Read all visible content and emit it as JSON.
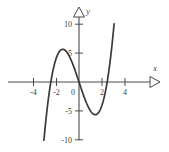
{
  "figure": {
    "background_color": "#ffffff",
    "axis_color": "#4a4a4a",
    "curve_color": "#3a3a3a",
    "label_color": "#3b3b3b"
  },
  "axes": {
    "x_axis_label": "x",
    "y_axis_label": "y",
    "x_arrow": "triangle-right",
    "y_arrow": "triangle-up",
    "x_tick_labels": [
      "-4",
      "-2",
      "0",
      "2",
      "4"
    ],
    "y_tick_labels": [
      "10",
      "5",
      "-5",
      "-10"
    ],
    "origin_label": "0"
  },
  "chart_data": {
    "type": "line",
    "title": "",
    "subtitle": "",
    "xlabel": "x",
    "ylabel": "y",
    "xlim": [
      -4.9,
      5.3
    ],
    "ylim": [
      -11.5,
      11.5
    ],
    "xticks": [
      -4,
      -2,
      0,
      2,
      4
    ],
    "yticks": [
      10,
      5,
      -5,
      -10
    ],
    "grid": false,
    "legend": null,
    "legend_position": "none",
    "annotations": [],
    "series": [
      {
        "name": "y = x^3 - 6x",
        "equation": "y = x^3 - 6x",
        "color": "#3a3a3a",
        "roots": [
          -2.45,
          0,
          2.45
        ],
        "local_maximum": {
          "x": -1.41,
          "y": 5.66
        },
        "local_minimum": {
          "x": 1.41,
          "y": -5.66
        },
        "x": [
          -3.05,
          -2.95,
          -2.85,
          -2.75,
          -2.65,
          -2.55,
          -2.45,
          -2.35,
          -2.25,
          -2.15,
          -2.05,
          -1.95,
          -1.85,
          -1.75,
          -1.65,
          -1.55,
          -1.45,
          -1.35,
          -1.25,
          -1.15,
          -1.05,
          -0.95,
          -0.85,
          -0.75,
          -0.65,
          -0.55,
          -0.45,
          -0.35,
          -0.25,
          -0.15,
          -0.05,
          0.05,
          0.15,
          0.25,
          0.35,
          0.45,
          0.55,
          0.65,
          0.75,
          0.85,
          0.95,
          1.05,
          1.15,
          1.25,
          1.35,
          1.45,
          1.55,
          1.65,
          1.75,
          1.85,
          1.95,
          2.05,
          2.15,
          2.25,
          2.35,
          2.45,
          2.55,
          2.65,
          2.75,
          2.85,
          2.95,
          3.05
        ],
        "y": [
          -10.07,
          -8.97,
          -7.86,
          -6.74,
          -5.71,
          -12.9,
          0.0,
          0.11,
          2.12,
          2.97,
          3.68,
          4.28,
          4.77,
          5.15,
          5.41,
          5.57,
          5.65,
          5.64,
          5.55,
          5.38,
          5.14,
          4.84,
          4.49,
          4.08,
          3.63,
          3.14,
          2.61,
          2.06,
          1.48,
          0.9,
          0.3,
          -0.3,
          -0.9,
          -1.48,
          -2.06,
          -2.61,
          -3.14,
          -3.63,
          -4.08,
          -4.49,
          -4.84,
          -5.14,
          -5.38,
          -5.55,
          -5.64,
          -5.65,
          -5.57,
          -5.41,
          -5.15,
          -4.77,
          -4.28,
          -3.68,
          -2.97,
          -2.12,
          -1.15,
          -0.06,
          1.28,
          2.68,
          4.3,
          6.05,
          8.0,
          10.07
        ]
      }
    ]
  },
  "geometry": {
    "origin_px": {
      "x": 79,
      "y": 82
    },
    "x_scale_px_per_unit": 11.5,
    "y_scale_px_per_unit": 5.78,
    "x_axis_y_px": 82,
    "y_axis_x_px": 79
  }
}
